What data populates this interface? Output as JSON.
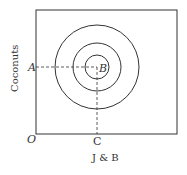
{
  "diagram": {
    "y_axis_label": "Coconuts",
    "x_axis_label": "J & B",
    "origin_label": "O",
    "point_a_label": "A",
    "bliss_point_label": "B",
    "point_c_label": "C",
    "circles": [
      {
        "r": 12
      },
      {
        "r": 24
      },
      {
        "r": 42
      }
    ],
    "colors": {
      "line": "#333333",
      "background": "#ffffff"
    }
  }
}
